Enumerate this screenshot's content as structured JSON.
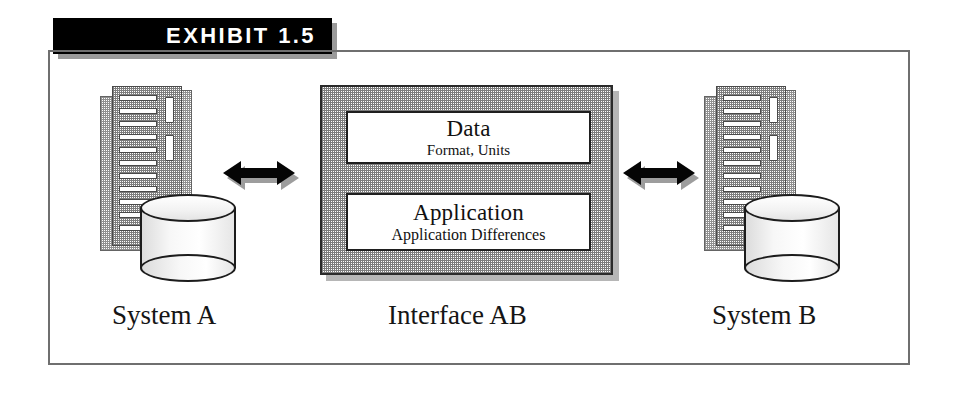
{
  "exhibit": {
    "banner_label": "EXHIBIT 1.5"
  },
  "diagram": {
    "left_system": {
      "caption": "System A",
      "server_icon": "server-cabinet-icon",
      "database_icon": "database-cylinder-icon"
    },
    "right_system": {
      "caption": "System B",
      "server_icon": "server-cabinet-icon",
      "database_icon": "database-cylinder-icon"
    },
    "interface": {
      "caption": "Interface AB",
      "cards": [
        {
          "title": "Data",
          "subtitle": "Format, Units"
        },
        {
          "title": "Application",
          "subtitle": "Application Differences"
        }
      ]
    },
    "connectors": [
      {
        "name": "left-connector",
        "icon": "double-headed-arrow-icon"
      },
      {
        "name": "right-connector",
        "icon": "double-headed-arrow-icon"
      }
    ]
  },
  "colors": {
    "banner_background": "#000000",
    "banner_text": "#ffffff",
    "frame_border": "#6f6f6f",
    "interface_fill": "#7d7d7d",
    "card_fill": "#ffffff",
    "outline": "#1c1c1c"
  }
}
